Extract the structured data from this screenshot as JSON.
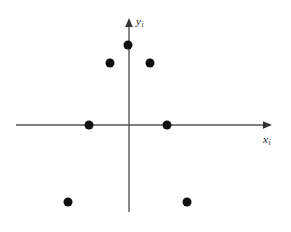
{
  "figure": {
    "width": 291,
    "height": 232,
    "background": "#ffffff"
  },
  "axes": {
    "x_axis": {
      "label_letter": "x",
      "label_subscript": "i",
      "color": "#555555",
      "start_px": 16,
      "end_px": 272,
      "y_px": 125,
      "arrow": "right"
    },
    "y_axis": {
      "label_letter": "y",
      "label_subscript": "i",
      "color": "#555555",
      "start_px": 212,
      "end_px": 18,
      "x_px": 129,
      "arrow": "up"
    },
    "origin": {
      "x_px": 129,
      "y_px": 125
    }
  },
  "chart_data": {
    "type": "scatter",
    "title": "",
    "xlabel": "x_i",
    "ylabel": "y_i",
    "grid": false,
    "legend": null,
    "axis_arrows": true,
    "unit_px": 38,
    "marker": {
      "shape": "circle",
      "color": "#111111",
      "diameter_px": 9
    },
    "xlim": [
      -3.0,
      3.8
    ],
    "ylim": [
      -2.3,
      2.8
    ],
    "series": [
      {
        "name": "points",
        "points": [
          {
            "x": 0.0,
            "y": 2.0,
            "px": 128,
            "py": 45
          },
          {
            "x": -0.5,
            "y": 1.6,
            "px": 110,
            "py": 63
          },
          {
            "x": 0.55,
            "y": 1.6,
            "px": 150,
            "py": 63
          },
          {
            "x": -1.05,
            "y": 0.0,
            "px": 89,
            "py": 125
          },
          {
            "x": 1.0,
            "y": 0.0,
            "px": 167,
            "py": 125
          },
          {
            "x": -1.6,
            "y": -2.0,
            "px": 68,
            "py": 202
          },
          {
            "x": 1.55,
            "y": -2.0,
            "px": 187,
            "py": 202
          }
        ]
      }
    ]
  }
}
